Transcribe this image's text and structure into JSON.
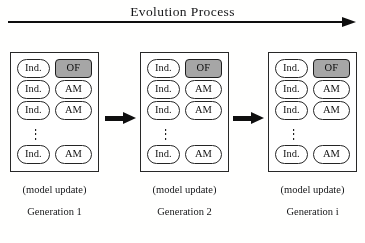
{
  "figure": {
    "title": "Evolution Process",
    "arrow_icon": "right-arrow-icon"
  },
  "generations": [
    {
      "id": "generation-1",
      "label": "Generation 1",
      "update_caption": "(model update)",
      "left": 10,
      "width": 89,
      "rows": [
        {
          "left": "Ind.",
          "right": "OF",
          "right_kind": "of"
        },
        {
          "left": "Ind.",
          "right": "AM",
          "right_kind": "am"
        },
        {
          "left": "Ind.",
          "right": "AM",
          "right_kind": "am"
        },
        {
          "left": "Ind.",
          "right": "AM",
          "right_kind": "am"
        }
      ],
      "ellipsis": "⋮",
      "ellipsis_before_row": 3
    },
    {
      "id": "generation-2",
      "label": "Generation 2",
      "update_caption": "(model update)",
      "left": 140,
      "width": 89,
      "rows": [
        {
          "left": "Ind.",
          "right": "OF",
          "right_kind": "of"
        },
        {
          "left": "Ind.",
          "right": "AM",
          "right_kind": "am"
        },
        {
          "left": "Ind.",
          "right": "AM",
          "right_kind": "am"
        },
        {
          "left": "Ind.",
          "right": "AM",
          "right_kind": "am"
        }
      ],
      "ellipsis": "⋮",
      "ellipsis_before_row": 3
    },
    {
      "id": "generation-i",
      "label": "Generation i",
      "update_caption": "(model update)",
      "left": 268,
      "width": 89,
      "rows": [
        {
          "left": "Ind.",
          "right": "OF",
          "right_kind": "of"
        },
        {
          "left": "Ind.",
          "right": "AM",
          "right_kind": "am"
        },
        {
          "left": "Ind.",
          "right": "AM",
          "right_kind": "am"
        },
        {
          "left": "Ind.",
          "right": "AM",
          "right_kind": "am"
        }
      ],
      "ellipsis": "⋮",
      "ellipsis_before_row": 3
    }
  ],
  "step_arrows": [
    {
      "id": "step-arrow-1",
      "left": 105
    },
    {
      "id": "step-arrow-2",
      "left": 233
    }
  ],
  "colors": {
    "of_fill": "#a5a5a5",
    "stroke": "#262626",
    "text": "#17181a",
    "background": "#fdfdfc"
  }
}
